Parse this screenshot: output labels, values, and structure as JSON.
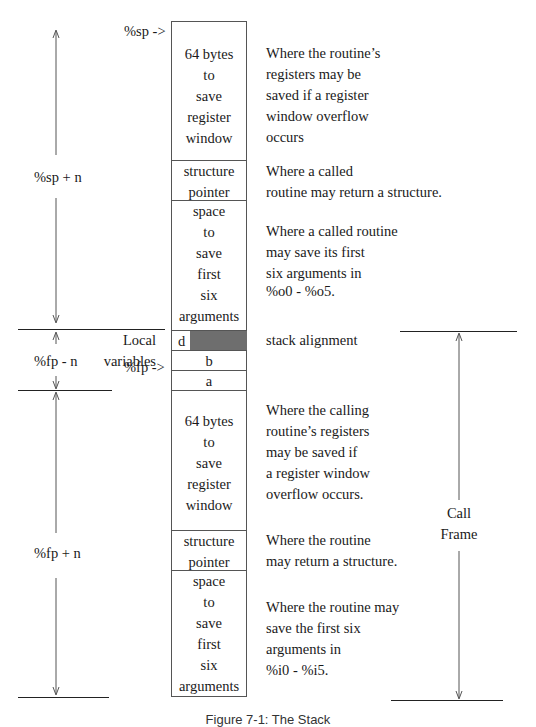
{
  "diagram": {
    "pointers": {
      "sp": "%sp ->",
      "fp": "%fp ->"
    },
    "left_labels": {
      "sp_plus_n": "%sp + n",
      "fp_minus_n": "%fp - n",
      "fp_plus_n": "%fp + n",
      "local_variables": [
        "Local",
        "variables"
      ]
    },
    "stack_cells": {
      "reg_window_top": [
        "64 bytes",
        "to",
        "save",
        "register",
        "window"
      ],
      "struct_ptr_top": [
        "structure",
        "pointer"
      ],
      "args_top": [
        "space",
        "to",
        "save",
        "first",
        "six",
        "arguments"
      ],
      "local_d": "d",
      "local_b": "b",
      "local_a": "a",
      "reg_window_bottom": [
        "64 bytes",
        "to",
        "save",
        "register",
        "window"
      ],
      "struct_ptr_bottom": [
        "structure",
        "pointer"
      ],
      "args_bottom": [
        "space",
        "to",
        "save",
        "first",
        "six",
        "arguments"
      ]
    },
    "descriptions": {
      "reg_window_top": [
        "Where the routine’s",
        "registers may be",
        "saved if a register",
        "window overflow",
        "occurs"
      ],
      "struct_ptr_top": [
        "Where a called",
        "routine may return a structure."
      ],
      "args_top": [
        "Where a called routine",
        "may save its first",
        "six arguments in",
        "%o0 - %o5."
      ],
      "alignment": "stack alignment",
      "reg_window_bottom": [
        "Where the calling",
        "routine’s registers",
        "may be saved if",
        "a register window",
        "overflow occurs."
      ],
      "struct_ptr_bottom": [
        "Where the routine",
        "may return a structure."
      ],
      "args_bottom": [
        "Where the routine may",
        "save the first six",
        "arguments  in",
        "%i0 - %i5."
      ]
    },
    "call_frame_label": [
      "Call",
      "Frame"
    ],
    "caption": "Figure 7-1: The Stack",
    "colors": {
      "alignment_fill": "#6e6e6e",
      "line": "#222222",
      "border": "#555555"
    }
  }
}
